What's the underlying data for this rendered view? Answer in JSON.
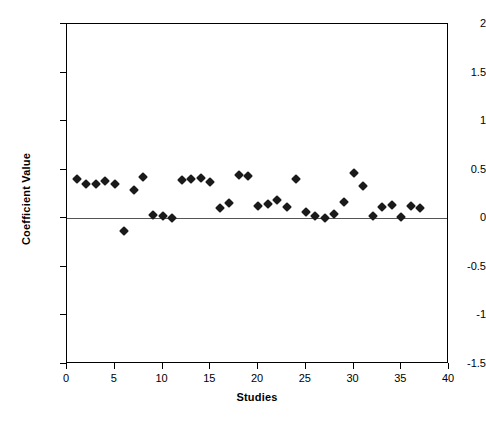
{
  "chart_data": {
    "type": "scatter",
    "title": "",
    "xlabel": "Studies",
    "ylabel": "Coefficient Value",
    "xlim": [
      0,
      40
    ],
    "ylim": [
      -1.5,
      2
    ],
    "xticks": [
      0,
      5,
      10,
      15,
      20,
      25,
      30,
      35,
      40
    ],
    "xtick_labels": [
      "0",
      "5",
      "10",
      "15",
      "20",
      "25",
      "30",
      "35",
      "40"
    ],
    "yticks": [
      -1.5,
      -1,
      -0.5,
      0,
      0.5,
      1,
      1.5,
      2
    ],
    "ytick_labels": [
      "-1.5",
      "-1",
      "-0.5",
      "0",
      "0.5",
      "1",
      "1.5",
      "2"
    ],
    "grid": false,
    "legend": false,
    "marker": "diamond",
    "marker_color": "#1a1a1a",
    "zero_line": 0,
    "series": [
      {
        "name": "Coefficient Value",
        "x": [
          1,
          2,
          3,
          4,
          5,
          6,
          7,
          8,
          9,
          10,
          11,
          12,
          13,
          14,
          15,
          16,
          17,
          18,
          19,
          20,
          21,
          22,
          23,
          24,
          25,
          26,
          27,
          28,
          29,
          30,
          31,
          32,
          33,
          34,
          35,
          36,
          37
        ],
        "y": [
          0.4,
          0.35,
          0.35,
          0.38,
          0.35,
          -0.13,
          0.29,
          0.43,
          0.03,
          0.02,
          0.0,
          0.39,
          0.4,
          0.41,
          0.37,
          0.11,
          0.16,
          0.45,
          0.44,
          0.13,
          0.15,
          0.19,
          0.12,
          0.4,
          0.06,
          0.02,
          0.0,
          0.04,
          0.17,
          0.47,
          0.33,
          0.02,
          0.12,
          0.14,
          0.01,
          0.13,
          0.11
        ]
      }
    ]
  }
}
